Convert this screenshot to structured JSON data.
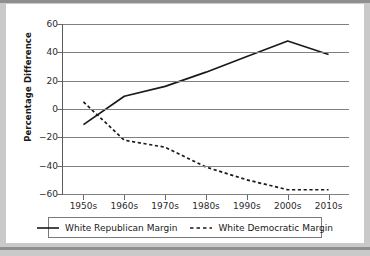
{
  "chart_data": {
    "type": "line",
    "title": "",
    "xlabel": "",
    "ylabel": "Percentage Difference",
    "categories": [
      "1950s",
      "1960s",
      "1970s",
      "1980s",
      "1990s",
      "2000s",
      "2010s"
    ],
    "ylim": [
      -60,
      60
    ],
    "yticks": [
      60,
      40,
      20,
      0,
      -20,
      -40,
      -60
    ],
    "ytick_labels": [
      "60",
      "40",
      "20",
      "0",
      "−20",
      "−40",
      "−60"
    ],
    "grid": true,
    "legend_position": "bottom",
    "series": [
      {
        "name": "White Republican Margin",
        "style": "solid",
        "color": "#1a1a1a",
        "values": [
          -11,
          9,
          16,
          26,
          37,
          48,
          38.5
        ]
      },
      {
        "name": "White Democratic Margin",
        "style": "dashed",
        "color": "#1a1a1a",
        "values": [
          5,
          -22,
          -27,
          -41,
          -50,
          -57,
          -57
        ]
      }
    ]
  },
  "legend": {
    "entries": [
      {
        "label": "White Republican Margin",
        "icon": "solid-line-swatch"
      },
      {
        "label": "White Democratic Margin",
        "icon": "dashed-line-swatch"
      }
    ]
  }
}
